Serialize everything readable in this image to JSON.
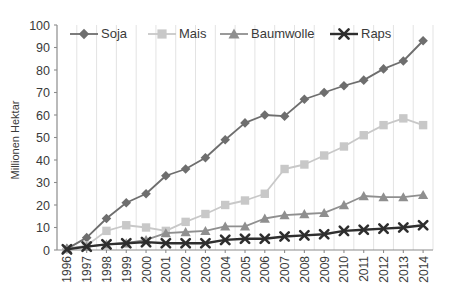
{
  "chart_data": {
    "type": "line",
    "title": "",
    "xlabel": "",
    "ylabel": "Millionen Hektar",
    "ylim": [
      0,
      100
    ],
    "yticks": [
      0,
      10,
      20,
      30,
      40,
      50,
      60,
      70,
      80,
      90,
      100
    ],
    "grid": "vertical",
    "legend_position": "top",
    "x": [
      "1996",
      "1997",
      "1998",
      "1999",
      "2000",
      "2001",
      "2002",
      "2003",
      "2004",
      "2005",
      "2006",
      "2007",
      "2008",
      "2009",
      "2010",
      "2011",
      "2012",
      "2013",
      "2014"
    ],
    "categories": [
      "1996",
      "1997",
      "1998",
      "1999",
      "2000",
      "2001",
      "2002",
      "2003",
      "2004",
      "2005",
      "2006",
      "2007",
      "2008",
      "2009",
      "2010",
      "2011",
      "2012",
      "2013",
      "2014"
    ],
    "series": [
      {
        "name": "Soja",
        "marker": "diamond",
        "color": "#6e6e6e",
        "values": [
          0.5,
          5.5,
          14.0,
          21.0,
          25.0,
          33.0,
          36.0,
          41.0,
          49.0,
          56.5,
          60.0,
          59.5,
          67.0,
          70.0,
          73.0,
          75.5,
          80.5,
          84.0,
          93.0
        ]
      },
      {
        "name": "Mais",
        "marker": "square",
        "color": "#c8c8c8",
        "values": [
          0.4,
          2.0,
          8.5,
          11.0,
          10.0,
          8.5,
          12.5,
          16.0,
          20.0,
          22.0,
          25.0,
          36.0,
          38.0,
          42.0,
          46.0,
          51.0,
          55.5,
          58.5,
          55.5
        ]
      },
      {
        "name": "Baumwolle",
        "marker": "triangle",
        "color": "#8f8f8f",
        "values": [
          0.8,
          1.5,
          2.5,
          3.0,
          4.5,
          7.5,
          8.0,
          8.5,
          10.5,
          10.5,
          14.0,
          15.5,
          16.0,
          16.5,
          20.0,
          24.0,
          23.5,
          23.5,
          24.5
        ]
      },
      {
        "name": "Raps",
        "marker": "x",
        "color": "#2e2e2e",
        "values": [
          0.3,
          1.5,
          2.5,
          3.0,
          3.5,
          3.0,
          3.0,
          3.0,
          4.5,
          5.0,
          5.0,
          6.0,
          6.5,
          7.0,
          8.5,
          9.0,
          9.5,
          10.0,
          11.0
        ]
      }
    ]
  },
  "legend": {
    "items": [
      {
        "label": "Soja",
        "marker": "diamond",
        "color": "#6e6e6e"
      },
      {
        "label": "Mais",
        "marker": "square",
        "color": "#c8c8c8"
      },
      {
        "label": "Baumwolle",
        "marker": "triangle",
        "color": "#8f8f8f"
      },
      {
        "label": "Raps",
        "marker": "x",
        "color": "#2e2e2e"
      }
    ]
  }
}
